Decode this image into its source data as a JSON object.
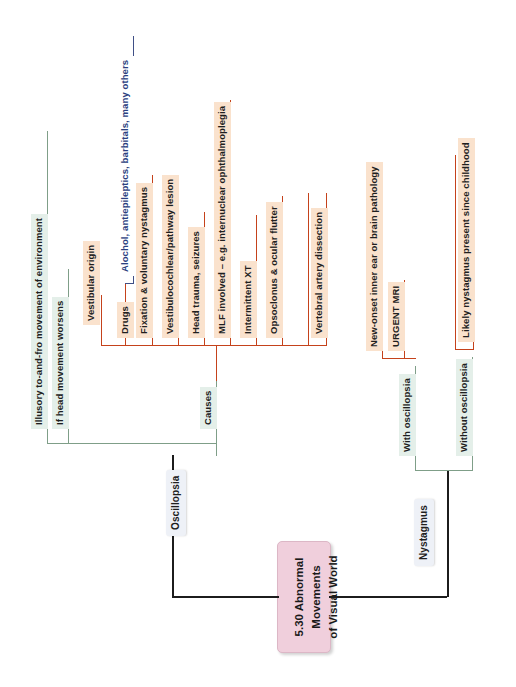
{
  "diagram": {
    "type": "mind-map",
    "orientation": "rotated-90-counterclockwise",
    "root": {
      "label": "5.30 Abnormal\nMovements\nof Visual World",
      "line1": "5.30 Abnormal",
      "line2": "Movements",
      "line3": "of Visual World",
      "color": "#f0cfdc"
    },
    "branches": [
      {
        "id": "oscillopsia",
        "label": "Oscillopsia",
        "color": "#eef1f7",
        "children": [
          {
            "label": "Illusory to-and-fro movement of environment",
            "color": "#e4efe9"
          },
          {
            "label": "If head movement worsens",
            "color": "#e4efe9"
          },
          {
            "label": "Causes",
            "color": "#e4efe9",
            "children": [
              {
                "label": "Drugs",
                "color": "#fae2cd",
                "children": [
                  {
                    "label": "Alochol, antiepileptics, barbitals, many others",
                    "color": "#ffffff"
                  }
                ]
              },
              {
                "label": "Vestibular origin",
                "color": "#fae2cd"
              },
              {
                "label": "Fixation & voluntary nystagmus",
                "color": "#fae2cd"
              },
              {
                "label": "Vestibulocochlear/pathway lesion",
                "color": "#fae2cd"
              },
              {
                "label": "Head trauma, seizures",
                "color": "#fae2cd"
              },
              {
                "label": "MLF involved – e.g. internuclear ophthalmoplegia",
                "color": "#fae2cd"
              },
              {
                "label": "Intermittent XT",
                "color": "#fae2cd"
              },
              {
                "label": "Opsoclonus & ocular flutter",
                "color": "#fae2cd"
              },
              {
                "label": "Vertebral artery dissection",
                "color": "#fae2cd"
              }
            ]
          }
        ]
      },
      {
        "id": "nystagmus",
        "label": "Nystagmus",
        "color": "#eef1f7",
        "children": [
          {
            "label": "With oscillopsia",
            "color": "#e4efe9",
            "children": [
              {
                "label": "New-onset inner ear or brain pathology",
                "color": "#fae2cd"
              },
              {
                "label": "URGENT MRI",
                "color": "#fae2cd"
              }
            ]
          },
          {
            "label": "Without oscillopsia",
            "color": "#e4efe9",
            "children": [
              {
                "label": "Likely nystagmus present since childhood",
                "color": "#fae2cd"
              }
            ]
          }
        ]
      }
    ],
    "palette": {
      "root_line": "#1c1c1c",
      "green_line": "#7f9e88",
      "orange_line": "#c5421b",
      "blue_line": "#3f4f86",
      "root_fill": "#f0cfdc",
      "green_fill": "#e4efe9",
      "orange_fill": "#fae2cd",
      "neutral_fill": "#eef1f7"
    }
  }
}
